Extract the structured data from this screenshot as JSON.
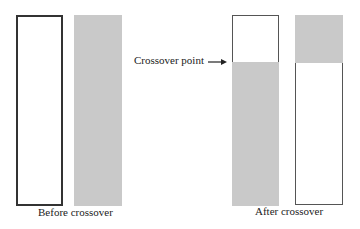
{
  "diagram": {
    "before": {
      "caption": "Before crossover",
      "bars": [
        {
          "name": "parent-1",
          "segments": [
            {
              "fill": "white",
              "portion": 1.0
            }
          ]
        },
        {
          "name": "parent-2",
          "segments": [
            {
              "fill": "gray",
              "portion": 1.0
            }
          ]
        }
      ]
    },
    "after": {
      "caption": "After crossover",
      "bars": [
        {
          "name": "child-1",
          "segments": [
            {
              "fill": "white",
              "portion": 0.25
            },
            {
              "fill": "gray",
              "portion": 0.75
            }
          ]
        },
        {
          "name": "child-2",
          "segments": [
            {
              "fill": "gray",
              "portion": 0.25
            },
            {
              "fill": "white",
              "portion": 0.75
            }
          ]
        }
      ]
    },
    "annotation": {
      "label": "Crossover point",
      "arrow": "right-arrow"
    },
    "colors": {
      "gray_fill": "#c9c9c9",
      "outline": "#333333",
      "background": "#ffffff"
    }
  }
}
